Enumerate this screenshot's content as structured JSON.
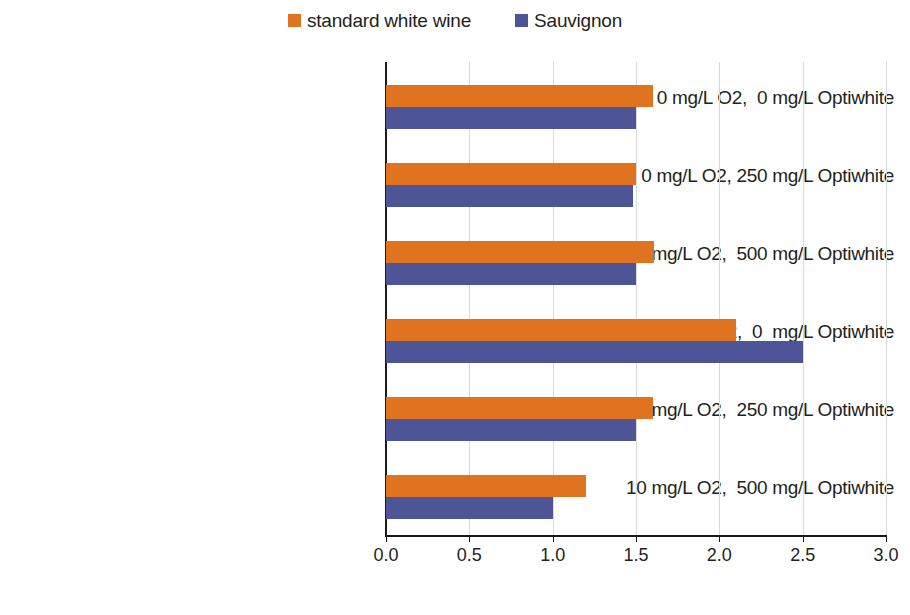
{
  "chart_data": {
    "type": "bar",
    "orientation": "horizontal",
    "title": "",
    "subtitle": "",
    "xlabel": "",
    "ylabel": "",
    "xlim": [
      0.0,
      3.0
    ],
    "xticks": [
      "0.0",
      "0.5",
      "1.0",
      "1.5",
      "2.0",
      "2.5",
      "3.0"
    ],
    "xtick_values": [
      0.0,
      0.5,
      1.0,
      1.5,
      2.0,
      2.5,
      3.0
    ],
    "grid": "vertical",
    "legend_position": "top-center",
    "categories": [
      "0 mg/L O2,  0 mg/L Optiwhite",
      "0 mg/L O2, 250 mg/L Optiwhite",
      "0 mg/L O2,  500 mg/L Optiwhite",
      "10 mg/L O2,  0  mg/L Optiwhite",
      "10 mg/L O2,  250 mg/L Optiwhite",
      "10 mg/L O2,  500 mg/L Optiwhite"
    ],
    "series": [
      {
        "name": "standard white wine",
        "color": "#E0731F",
        "values": [
          1.6,
          1.5,
          1.61,
          2.1,
          1.6,
          1.2
        ]
      },
      {
        "name": "Sauvignon",
        "color": "#4E5596",
        "values": [
          1.5,
          1.48,
          1.5,
          2.5,
          1.5,
          1.0
        ]
      }
    ]
  },
  "legend": {
    "items": [
      {
        "label": "standard white wine",
        "swatch": "legend-swatch-orange",
        "color": "#E0731F"
      },
      {
        "label": "Sauvignon",
        "swatch": "legend-swatch-blue",
        "color": "#4E5596"
      }
    ]
  },
  "axis": {
    "x_tick_labels": [
      "0.0",
      "0.5",
      "1.0",
      "1.5",
      "2.0",
      "2.5",
      "3.0"
    ]
  }
}
